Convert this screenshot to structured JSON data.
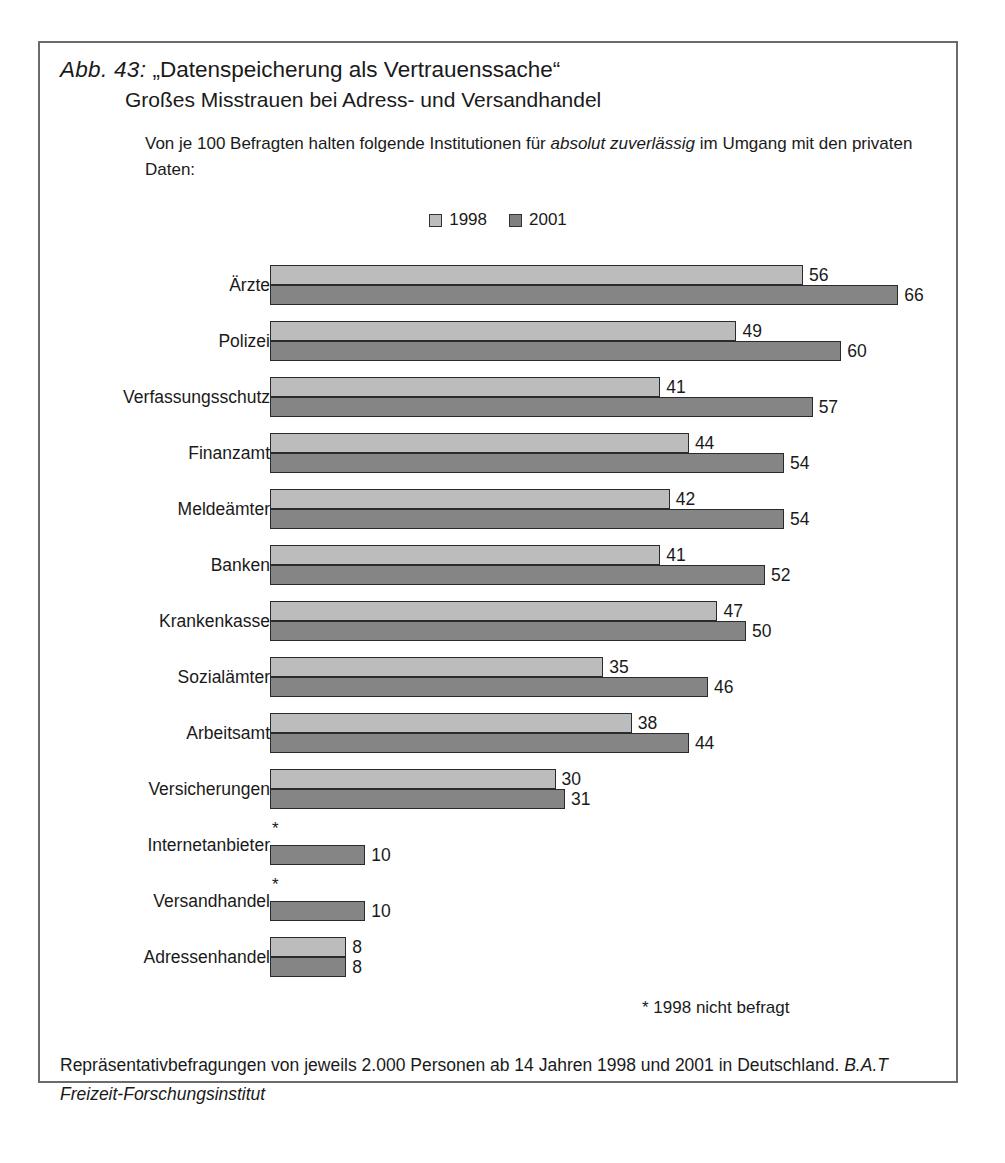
{
  "figure": {
    "label": "Abb. 43:",
    "title_line1": "„Datenspeicherung als Vertrauenssache“",
    "title_line2": "Großes Misstrauen bei Adress- und Versandhandel",
    "subtitle_pre": "Von je 100 Befragten halten folgende Institutionen für ",
    "subtitle_em": "absolut zuverlässig",
    "subtitle_post": " im Umgang mit den privaten Daten:",
    "footnote": "* 1998 nicht befragt",
    "source_pre": "Repräsentativbefragungen von jeweils 2.000 Personen ab 14 Jahren 1998 und 2001 in Deutschland. ",
    "source_em": "B.A.T Freizeit-Forschungsinstitut",
    "star": "*"
  },
  "colors": {
    "series_1998": "#bcbcbc",
    "series_2001": "#858585",
    "frame": "#6b6b6b",
    "bar_outline": "#2b2b2b",
    "text": "#1a1a1a"
  },
  "chart_data": {
    "type": "bar",
    "orientation": "horizontal",
    "subtitle": "Von je 100 Befragten halten folgende Institutionen für absolut zuverlässig im Umgang mit den privaten Daten:",
    "xlabel": "",
    "ylabel": "",
    "xlim": [
      0,
      70
    ],
    "grid": false,
    "legend_position": "top-center",
    "categories": [
      "Ärzte",
      "Polizei",
      "Verfassungsschutz",
      "Finanzamt",
      "Meldeämter",
      "Banken",
      "Krankenkasse",
      "Sozialämter",
      "Arbeitsamt",
      "Versicherungen",
      "Internetanbieter",
      "Versandhandel",
      "Adressenhandel"
    ],
    "series": [
      {
        "name": "1998",
        "color": "#bcbcbc",
        "values": [
          56,
          49,
          41,
          44,
          42,
          41,
          47,
          35,
          38,
          30,
          null,
          null,
          8
        ],
        "value_labels": [
          "56",
          "49",
          "41",
          "44",
          "42",
          "41",
          "47",
          "35",
          "38",
          "30",
          "*",
          "*",
          "8"
        ]
      },
      {
        "name": "2001",
        "color": "#858585",
        "values": [
          66,
          60,
          57,
          54,
          54,
          52,
          50,
          46,
          44,
          31,
          10,
          10,
          8
        ],
        "value_labels": [
          "66",
          "60",
          "57",
          "54",
          "54",
          "52",
          "50",
          "46",
          "44",
          "31",
          "10",
          "10",
          "8"
        ]
      }
    ],
    "annotations": [
      "* 1998 nicht befragt"
    ],
    "source": "Repräsentativbefragungen von jeweils 2.000 Personen ab 14 Jahren 1998 und 2001 in Deutschland. B.A.T Freizeit-Forschungsinstitut"
  },
  "legend": {
    "items": [
      {
        "label": "1998",
        "swatch": "legend-swatch-1998"
      },
      {
        "label": "2001",
        "swatch": "legend-swatch-2001"
      }
    ]
  }
}
